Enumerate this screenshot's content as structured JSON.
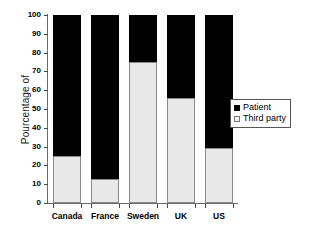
{
  "chart_data": {
    "type": "bar",
    "subtype": "stacked-100-percent",
    "title": "",
    "xlabel": "",
    "ylabel": "Pourcentage of",
    "ylim": [
      0,
      100
    ],
    "ytick_labels": [
      "100",
      "90",
      "80",
      "70",
      "60",
      "50",
      "40",
      "30",
      "20",
      "10",
      "0"
    ],
    "ytick_values": [
      100,
      90,
      80,
      70,
      60,
      50,
      40,
      30,
      20,
      10,
      0
    ],
    "grid": false,
    "legend_position": "right",
    "categories": [
      "Canada",
      "France",
      "Sweden",
      "UK",
      "US"
    ],
    "series": [
      {
        "name": "Patient",
        "color": "#000000",
        "values": [
          75,
          87,
          25,
          44,
          71
        ]
      },
      {
        "name": "Third party",
        "color": "#e8e8e8",
        "values": [
          25,
          13,
          75,
          56,
          29
        ]
      }
    ]
  },
  "legend": {
    "entries": [
      {
        "label": "Patient",
        "swatch": "filled-black-square"
      },
      {
        "label": "Third party",
        "swatch": "empty-white-square"
      }
    ]
  },
  "colors": {
    "patient": "#000000",
    "third_party": "#e8e8e8",
    "axis": "#6b6b6b",
    "background": "#ffffff"
  }
}
